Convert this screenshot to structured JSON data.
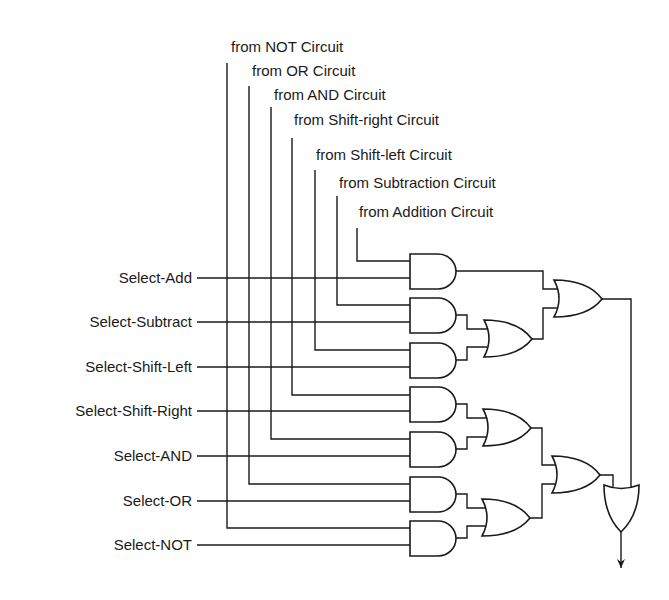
{
  "diagram": {
    "type": "logic-circuit",
    "source_inputs": [
      {
        "label": "from NOT Circuit"
      },
      {
        "label": "from OR Circuit"
      },
      {
        "label": "from AND Circuit"
      },
      {
        "label": "from Shift-right Circuit"
      },
      {
        "label": "from Shift-left Circuit"
      },
      {
        "label": "from Subtraction Circuit"
      },
      {
        "label": "from Addition Circuit"
      }
    ],
    "select_inputs": [
      {
        "label": "Select-Add"
      },
      {
        "label": "Select-Subtract"
      },
      {
        "label": "Select-Shift-Left"
      },
      {
        "label": "Select-Shift-Right"
      },
      {
        "label": "Select-AND"
      },
      {
        "label": "Select-OR"
      },
      {
        "label": "Select-NOT"
      }
    ],
    "gates": {
      "and_count": 7,
      "or_count": 5,
      "and_gates": [
        {
          "id": "and-add",
          "inputs": [
            "Select-Add",
            "from Addition Circuit"
          ]
        },
        {
          "id": "and-subtract",
          "inputs": [
            "from Subtraction Circuit",
            "Select-Subtract"
          ]
        },
        {
          "id": "and-shift-left",
          "inputs": [
            "from Shift-left Circuit",
            "Select-Shift-Left"
          ]
        },
        {
          "id": "and-shift-right",
          "inputs": [
            "from Shift-right Circuit",
            "Select-Shift-Right"
          ]
        },
        {
          "id": "and-and",
          "inputs": [
            "Select-AND",
            "from AND Circuit"
          ]
        },
        {
          "id": "and-or",
          "inputs": [
            "from OR Circuit",
            "Select-OR"
          ]
        },
        {
          "id": "and-not",
          "inputs": [
            "from NOT Circuit",
            "Select-NOT"
          ]
        }
      ],
      "or_gates": [
        {
          "id": "or-sub-shl",
          "inputs": [
            "and-subtract",
            "and-shift-left"
          ]
        },
        {
          "id": "or-top",
          "inputs": [
            "and-add",
            "or-sub-shl"
          ]
        },
        {
          "id": "or-shr-and",
          "inputs": [
            "and-shift-right",
            "and-and"
          ]
        },
        {
          "id": "or-or-not",
          "inputs": [
            "and-or",
            "and-not"
          ]
        },
        {
          "id": "or-bottom",
          "inputs": [
            "or-shr-and",
            "or-or-not"
          ]
        },
        {
          "id": "or-final",
          "inputs": [
            "or-bottom",
            "or-top"
          ]
        }
      ]
    },
    "output": {
      "direction": "down",
      "symbol": "arrow"
    }
  }
}
